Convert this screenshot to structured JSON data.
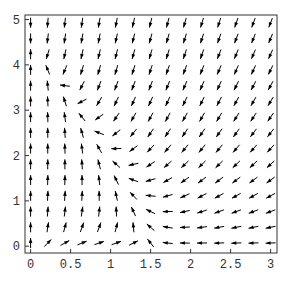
{
  "chart_data": {
    "type": "quiver",
    "title": "",
    "xlabel": "",
    "ylabel": "",
    "xlim": [
      -0.07,
      3.08
    ],
    "ylim": [
      -0.15,
      5.1
    ],
    "x_ticks": [
      0,
      0.5,
      1,
      1.5,
      2,
      2.5,
      3
    ],
    "x_tick_labels": [
      "0",
      "0.5",
      "1",
      "1.5",
      "2",
      "2.5",
      "3"
    ],
    "y_ticks": [
      0,
      1,
      2,
      3,
      4,
      5
    ],
    "y_tick_labels": [
      "0",
      "1",
      "2",
      "3",
      "4",
      "5"
    ],
    "grid": false,
    "legend": null,
    "grid_points": {
      "x_start": 0,
      "x_end": 3,
      "nx": 15,
      "y_start": 0.07,
      "y_end": 4.93,
      "ny": 15
    },
    "field_description": "Vectors point upward near x=0 at low y, downward near top-left, toward lower-left in upper right region; bottom row points right for x<1.5 and left for x>1.5; converging near (1.5, 0.3)",
    "arrow_color": "#000000"
  }
}
